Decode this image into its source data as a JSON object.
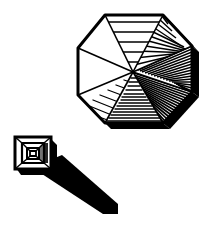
{
  "figure": {
    "title": "Octagonal vaulted dome and square stepped lantern with cast shadow",
    "style": "monochrome engraving / line art",
    "background_color": "#ffffff",
    "ink_color": "#000000",
    "canvas": {
      "width": 219,
      "height": 226
    }
  },
  "objects": [
    {
      "id": "octagonal-dome",
      "name": "Octagonal vaulted dome",
      "description": "Regular octagon seen in perspective from above, divided into eight triangular webs radiating from an off-centre apex, each web ruled with horizontal hatching of varying density.",
      "center_apex": {
        "x": 133,
        "y": 72
      },
      "segment_count": 8,
      "outline_points": "105,15 163,15 192,46 192,92 163,123 105,123 78,95 78,48",
      "rim_color": "#000000",
      "segments": [
        {
          "index": 1,
          "name": "segment-north",
          "shading": "light",
          "hatch_lines": 5
        },
        {
          "index": 2,
          "name": "segment-northeast",
          "shading": "medium",
          "hatch_lines": 11
        },
        {
          "index": 3,
          "name": "segment-east",
          "shading": "dense",
          "hatch_lines": 20
        },
        {
          "index": 4,
          "name": "segment-southeast",
          "shading": "very-dense",
          "hatch_lines": 26
        },
        {
          "index": 5,
          "name": "segment-south",
          "shading": "medium",
          "hatch_lines": 14
        },
        {
          "index": 6,
          "name": "segment-southwest",
          "shading": "light",
          "hatch_lines": 7
        },
        {
          "index": 7,
          "name": "segment-west",
          "shading": "blank",
          "hatch_lines": 0
        },
        {
          "index": 8,
          "name": "segment-northwest",
          "shading": "blank",
          "hatch_lines": 0
        }
      ]
    },
    {
      "id": "square-lantern",
      "name": "Square stepped lantern",
      "description": "Small square skylight drawn as four nested squares in perspective, the innermost forming the open oculus, with a solid shaded right flank.",
      "bounds": {
        "x": 14,
        "y": 136,
        "width": 40,
        "height": 40
      },
      "nested_ring_count": 4
    },
    {
      "id": "cast-shadow",
      "name": "Cast shadow",
      "description": "Long solid black shadow projected down and to the right from the square lantern.",
      "polygon_points": "45,162 62,155 118,204 118,214 103,214 42,174",
      "fill_color": "#000000"
    }
  ]
}
